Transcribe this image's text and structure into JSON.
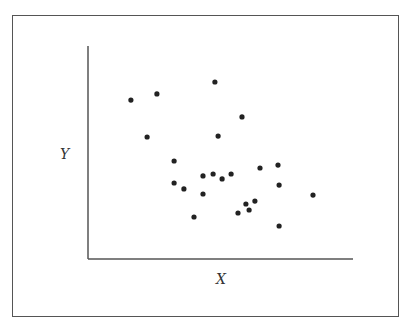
{
  "chart_data": {
    "type": "scatter",
    "title": "",
    "xlabel": "X",
    "ylabel": "Y",
    "xlim": [
      0,
      100
    ],
    "ylim": [
      0,
      100
    ],
    "grid": false,
    "ticks": false,
    "legend": null,
    "marker_color": "#222222",
    "axis_color": "#555555",
    "series": [
      {
        "name": "points",
        "x": [
          16.2,
          26.0,
          47.9,
          22.3,
          49.1,
          58.1,
          32.5,
          32.5,
          36.2,
          40.0,
          43.4,
          43.4,
          47.2,
          50.6,
          54.0,
          64.9,
          71.7,
          72.1,
          56.6,
          59.6,
          60.8,
          63.0,
          72.1,
          84.9
        ],
        "y": [
          74.6,
          77.5,
          83.1,
          57.3,
          57.7,
          66.7,
          46.0,
          35.7,
          32.9,
          19.7,
          39.0,
          30.5,
          39.9,
          37.6,
          39.9,
          42.7,
          44.1,
          34.7,
          21.6,
          25.8,
          23.0,
          27.2,
          15.5,
          30.0
        ]
      }
    ]
  },
  "labels": {
    "x_axis": "X",
    "y_axis": "Y"
  }
}
